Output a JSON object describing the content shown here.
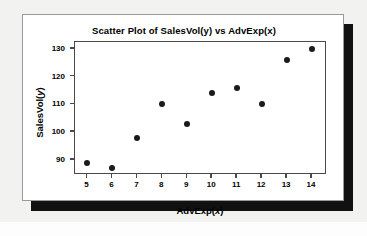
{
  "chart_data": {
    "type": "scatter",
    "title": "Scatter Plot of SalesVol(y) vs AdvExp(x)",
    "xlabel": "AdvExp(x)",
    "ylabel": "SalesVol(y)",
    "xlabel_parts": {
      "text": "AdvExp(",
      "italic": "x",
      "tail": ")"
    },
    "ylabel_parts": {
      "text": "SalesVol(",
      "italic": "y",
      "tail": ")"
    },
    "x": [
      5,
      6,
      7,
      8,
      9,
      10,
      11,
      12,
      13,
      14
    ],
    "values": [
      89,
      87,
      98,
      110,
      103,
      114,
      116,
      110,
      126,
      130
    ],
    "points": [
      {
        "x": 5,
        "y": 89
      },
      {
        "x": 6,
        "y": 87
      },
      {
        "x": 7,
        "y": 98
      },
      {
        "x": 8,
        "y": 110
      },
      {
        "x": 9,
        "y": 103
      },
      {
        "x": 10,
        "y": 114
      },
      {
        "x": 11,
        "y": 116
      },
      {
        "x": 12,
        "y": 110
      },
      {
        "x": 13,
        "y": 126
      },
      {
        "x": 14,
        "y": 130
      }
    ],
    "xticks": [
      5,
      6,
      7,
      8,
      9,
      10,
      11,
      12,
      13,
      14
    ],
    "yticks": [
      90,
      100,
      110,
      120,
      130
    ],
    "xlim": [
      4.5,
      14.6
    ],
    "ylim": [
      84.5,
      132.5
    ],
    "grid": false,
    "legend": false,
    "marker": "filled-circle",
    "marker_color": "#1a1a1a",
    "frame_color": "#4a4a4a",
    "background_color": "#ffffff",
    "card_color": "#ffffff",
    "shadow_color": "#111111",
    "page_color": "#f2f2f0"
  }
}
